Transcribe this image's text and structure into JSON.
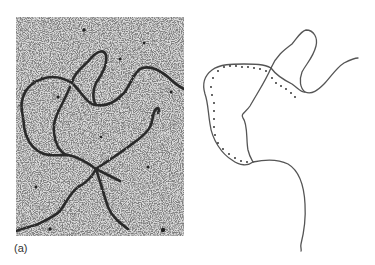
{
  "figure": {
    "panel_label": "(a)",
    "micrograph": {
      "description": "electron micrograph of a looped DNA strand on a grainy speckled background",
      "background_color": "#d8d8d8",
      "strand_color": "#2a2a2a"
    },
    "tracing": {
      "description": "line tracing of the micrograph strand with a dotted line marking one looped region",
      "line_color": "#555555",
      "dot_color": "#333333"
    }
  }
}
